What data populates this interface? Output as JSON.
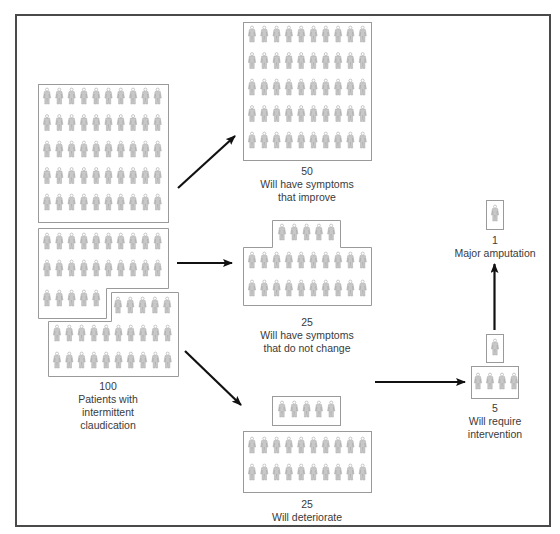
{
  "diagram": {
    "type": "flow-pictogram",
    "colors": {
      "frame": "#4a4a4a",
      "box_border": "#9a9a9a",
      "figure": "#b5b5b5",
      "arrow": "#111111",
      "text": "#3a3a3a"
    }
  },
  "nodes": {
    "source": {
      "count": "100",
      "line1": "Patients with",
      "line2": "intermittent",
      "line3": "claudication"
    },
    "improve": {
      "count": "50",
      "line1": "Will have symptoms",
      "line2": "that improve"
    },
    "unchanged": {
      "count": "25",
      "line1": "Will have symptoms",
      "line2": "that do not change"
    },
    "deteriorate": {
      "count": "25",
      "line1": "Will deteriorate"
    },
    "intervention": {
      "count": "5",
      "line1": "Will require",
      "line2": "intervention"
    },
    "amputation": {
      "count": "1",
      "line1": "Major amputation"
    }
  },
  "edges": [
    {
      "from": "source",
      "to": "improve"
    },
    {
      "from": "source",
      "to": "unchanged"
    },
    {
      "from": "source",
      "to": "deteriorate"
    },
    {
      "from": "deteriorate",
      "to": "intervention"
    },
    {
      "from": "intervention",
      "to": "amputation"
    }
  ],
  "icon": "person-figure-icon"
}
